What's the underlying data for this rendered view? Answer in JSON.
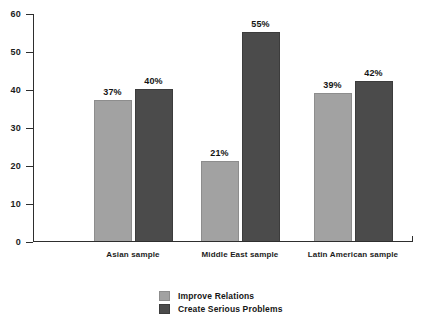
{
  "chart_data": {
    "type": "bar",
    "title": "",
    "subtitle": "",
    "xlabel": "",
    "ylabel": "",
    "ylim": [
      0,
      60
    ],
    "yticks": [
      "0",
      "10",
      "20",
      "30",
      "40",
      "50",
      "60"
    ],
    "grid": false,
    "legend_position": "bottom-center",
    "categories": [
      "Asian sample",
      "Middle East sample",
      "Latin American sample"
    ],
    "series": [
      {
        "name": "Improve Relations",
        "color": "#a2a2a2",
        "values": [
          37,
          21,
          39
        ],
        "labels": [
          "37%",
          "21%",
          "39%"
        ]
      },
      {
        "name": "Create Serious Problems",
        "color": "#4b4b4b",
        "values": [
          40,
          55,
          42
        ],
        "labels": [
          "40%",
          "55%",
          "42%"
        ]
      }
    ]
  },
  "legend": {
    "items": [
      {
        "label": "Improve Relations",
        "swatch": "light-gray-swatch"
      },
      {
        "label": "Create Serious Problems",
        "swatch": "dark-gray-swatch"
      }
    ]
  },
  "colors": {
    "series_light": "#a2a2a2",
    "series_dark": "#4b4b4b",
    "axis": "#2e2e2e",
    "text": "#1c1c1c",
    "background": "#ffffff"
  }
}
